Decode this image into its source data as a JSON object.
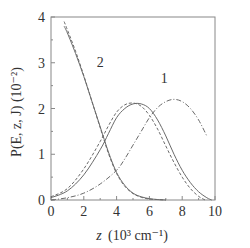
{
  "chart_data": {
    "type": "line",
    "title": "",
    "xlabel": "z (10³ cm⁻¹)",
    "ylabel": "P(E, z, J) (10⁻²)",
    "xlim": [
      0,
      10
    ],
    "ylim": [
      0,
      4
    ],
    "xticks": [
      0,
      2,
      4,
      6,
      8,
      10
    ],
    "yticks": [
      0,
      1,
      2,
      3,
      4
    ],
    "grid": false,
    "legend": "none (inline curve labels)",
    "annotations": [
      {
        "text": "1",
        "x": 6.9,
        "y": 2.55
      },
      {
        "text": "2",
        "x": 3.0,
        "y": 2.9
      }
    ],
    "series": [
      {
        "name": "2 (solid)",
        "style": "solid",
        "x": [
          0.8,
          1.0,
          1.5,
          2.0,
          2.5,
          3.0,
          3.5,
          4.0,
          4.5,
          5.0,
          5.5,
          6.0,
          6.5,
          7.0
        ],
        "y": [
          3.8,
          3.65,
          3.2,
          2.7,
          2.15,
          1.6,
          1.05,
          0.6,
          0.32,
          0.15,
          0.07,
          0.03,
          0.01,
          0.0
        ]
      },
      {
        "name": "2 (dashed)",
        "style": "dashed",
        "x": [
          0.8,
          1.0,
          1.5,
          2.0,
          2.5,
          3.0,
          3.5,
          4.0,
          4.5,
          5.0,
          5.5,
          6.0,
          6.5,
          7.0
        ],
        "y": [
          3.9,
          3.72,
          3.25,
          2.72,
          2.15,
          1.58,
          1.02,
          0.58,
          0.3,
          0.14,
          0.06,
          0.02,
          0.01,
          0.0
        ]
      },
      {
        "name": "1 (solid)",
        "style": "solid",
        "x": [
          0,
          1,
          2,
          3,
          3.5,
          4,
          4.5,
          5,
          5.5,
          6,
          6.5,
          7,
          7.5,
          8,
          8.5,
          9,
          9.5,
          9.8
        ],
        "y": [
          0.05,
          0.2,
          0.55,
          1.1,
          1.45,
          1.8,
          2.0,
          2.1,
          2.1,
          2.0,
          1.75,
          1.4,
          1.0,
          0.65,
          0.38,
          0.18,
          0.05,
          0.0
        ]
      },
      {
        "name": "1 (dashed)",
        "style": "dashed",
        "x": [
          0,
          1,
          2,
          3,
          3.5,
          4,
          4.5,
          5,
          5.5,
          6,
          6.5,
          7,
          7.5,
          8,
          8.5,
          9,
          9.4
        ],
        "y": [
          0.07,
          0.25,
          0.68,
          1.28,
          1.62,
          1.92,
          2.08,
          2.12,
          2.05,
          1.85,
          1.55,
          1.18,
          0.82,
          0.5,
          0.25,
          0.08,
          0.0
        ]
      },
      {
        "name": "1 (dash-dot)",
        "style": "dash-dot",
        "x": [
          0,
          1,
          2,
          3,
          4,
          4.5,
          5,
          5.5,
          6,
          6.5,
          7,
          7.5,
          8,
          8.5,
          9,
          9.5
        ],
        "y": [
          0.0,
          0.05,
          0.15,
          0.35,
          0.65,
          0.9,
          1.2,
          1.5,
          1.8,
          2.02,
          2.15,
          2.2,
          2.15,
          2.0,
          1.75,
          1.4
        ]
      }
    ]
  },
  "axis": {
    "x_label_main": "z",
    "x_label_unit": "(10³ cm⁻¹)",
    "y_label": "P(E, z, J) (10⁻²)"
  },
  "colors": {
    "frame": "#888888",
    "curve": "#6a6a6a",
    "text": "#333333"
  }
}
